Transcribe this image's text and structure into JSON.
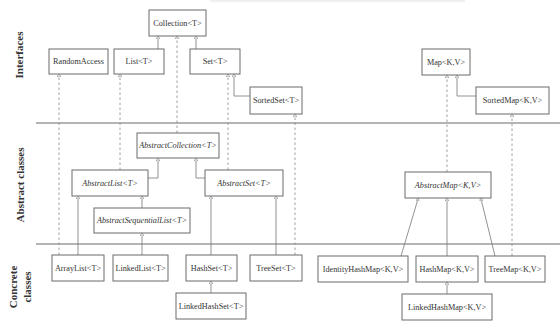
{
  "diagram": {
    "sections": [
      {
        "id": "interfaces",
        "label": "Interfaces"
      },
      {
        "id": "abstract",
        "label": "Abstract classes"
      },
      {
        "id": "concrete",
        "label": "Concrete classes",
        "lines": [
          "Concrete",
          "classes"
        ]
      }
    ],
    "interfaces": {
      "collection": "Collection<T>",
      "random_access": "RandomAccess",
      "list": "List<T>",
      "set": "Set<T>",
      "sorted_set": "SortedSet<T>",
      "map": "Map<K,V>",
      "sorted_map": "SortedMap<K,V>"
    },
    "abstract_classes": {
      "abstract_collection": "AbstractCollection<T>",
      "abstract_list": "AbstractList<T>",
      "abstract_set": "AbstractSet<T>",
      "abstract_sequential_list": "AbstractSequentialList<T>",
      "abstract_map": "AbstractMap<K,V>"
    },
    "concrete_classes": {
      "array_list": "ArrayList<T>",
      "linked_list": "LinkedList<T>",
      "hash_set": "HashSet<T>",
      "tree_set": "TreeSet<T>",
      "linked_hash_set": "LinkedHashSet<T>",
      "identity_hash_map": "IdentityHashMap<K,V>",
      "hash_map": "HashMap<K,V>",
      "tree_map": "TreeMap<K,V>",
      "linked_hash_map": "LinkedHashMap<K,V>"
    },
    "relationships": [
      {
        "from": "List<T>",
        "to": "Collection<T>",
        "kind": "extends"
      },
      {
        "from": "Set<T>",
        "to": "Collection<T>",
        "kind": "extends"
      },
      {
        "from": "SortedSet<T>",
        "to": "Set<T>",
        "kind": "extends"
      },
      {
        "from": "SortedMap<K,V>",
        "to": "Map<K,V>",
        "kind": "extends"
      },
      {
        "from": "AbstractCollection<T>",
        "to": "Collection<T>",
        "kind": "implements"
      },
      {
        "from": "AbstractList<T>",
        "to": "List<T>",
        "kind": "implements"
      },
      {
        "from": "AbstractSet<T>",
        "to": "Set<T>",
        "kind": "implements"
      },
      {
        "from": "AbstractMap<K,V>",
        "to": "Map<K,V>",
        "kind": "implements"
      },
      {
        "from": "AbstractList<T>",
        "to": "AbstractCollection<T>",
        "kind": "extends"
      },
      {
        "from": "AbstractSet<T>",
        "to": "AbstractCollection<T>",
        "kind": "extends"
      },
      {
        "from": "AbstractSequentialList<T>",
        "to": "AbstractList<T>",
        "kind": "extends"
      },
      {
        "from": "ArrayList<T>",
        "to": "AbstractList<T>",
        "kind": "extends"
      },
      {
        "from": "ArrayList<T>",
        "to": "RandomAccess",
        "kind": "implements"
      },
      {
        "from": "LinkedList<T>",
        "to": "AbstractSequentialList<T>",
        "kind": "extends"
      },
      {
        "from": "HashSet<T>",
        "to": "AbstractSet<T>",
        "kind": "extends"
      },
      {
        "from": "TreeSet<T>",
        "to": "AbstractSet<T>",
        "kind": "extends"
      },
      {
        "from": "TreeSet<T>",
        "to": "SortedSet<T>",
        "kind": "implements"
      },
      {
        "from": "LinkedHashSet<T>",
        "to": "HashSet<T>",
        "kind": "extends"
      },
      {
        "from": "IdentityHashMap<K,V>",
        "to": "AbstractMap<K,V>",
        "kind": "extends"
      },
      {
        "from": "HashMap<K,V>",
        "to": "AbstractMap<K,V>",
        "kind": "extends"
      },
      {
        "from": "TreeMap<K,V>",
        "to": "AbstractMap<K,V>",
        "kind": "extends"
      },
      {
        "from": "TreeMap<K,V>",
        "to": "SortedMap<K,V>",
        "kind": "implements"
      },
      {
        "from": "LinkedHashMap<K,V>",
        "to": "HashMap<K,V>",
        "kind": "extends"
      }
    ]
  }
}
